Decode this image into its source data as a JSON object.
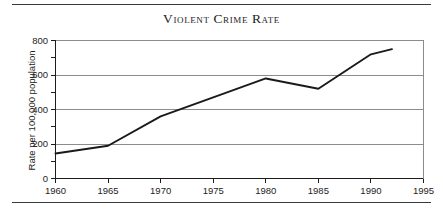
{
  "chart_data": {
    "type": "line",
    "title": "Violent Crime Rate",
    "xlabel": "",
    "ylabel": "Rate per 100,000 population",
    "xlim": [
      1960,
      1995
    ],
    "ylim": [
      0,
      800
    ],
    "grid": "horizontal-major",
    "legend": "none",
    "x_ticks": [
      "1960",
      "1965",
      "1970",
      "1975",
      "1980",
      "1985",
      "1990",
      "1995"
    ],
    "x_tick_values": [
      1960,
      1965,
      1970,
      1975,
      1980,
      1985,
      1990,
      1995
    ],
    "y_ticks": [
      "0",
      "200",
      "400",
      "600",
      "800"
    ],
    "y_tick_values": [
      0,
      200,
      400,
      600,
      800
    ],
    "y_minor_tick_values": [
      100,
      300,
      500,
      700
    ],
    "series": [
      {
        "name": "Violent crime rate",
        "color": "#1a1a1a",
        "x": [
          1960,
          1965,
          1970,
          1975,
          1980,
          1985,
          1990,
          1992
        ],
        "values": [
          145,
          190,
          360,
          470,
          580,
          520,
          720,
          750
        ]
      }
    ]
  },
  "figure": {
    "title": "Violent Crime Rate",
    "y_axis_title": "Rate per 100,000 population",
    "axis_color": "#1c1c1c",
    "gridline_color": "#8c8c8c",
    "line_color": "#1a1a1a"
  }
}
